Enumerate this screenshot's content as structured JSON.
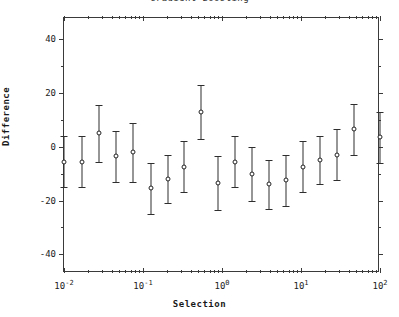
{
  "chart_data": {
    "type": "scatter",
    "title": "Gradient Boosting",
    "xlabel": "Selection",
    "ylabel": "Difference",
    "xscale": "log",
    "yscale": "linear",
    "xlim": [
      0.01,
      100
    ],
    "ylim": [
      -47,
      48
    ],
    "yticks": [
      40,
      20,
      0,
      -20,
      -40
    ],
    "ytick_labels": [
      "40",
      "20",
      "0",
      "-20",
      "-40"
    ],
    "xticks": [
      0.01,
      0.1,
      1,
      10,
      100
    ],
    "xtick_labels": [
      "10-2",
      "10-1",
      "100",
      "101",
      "102"
    ],
    "xtick_mantissa": [
      "10",
      "10",
      "10",
      "10",
      "10"
    ],
    "xtick_exponent": [
      "-2",
      "-1",
      "0",
      "1",
      "2"
    ],
    "grid": false,
    "legend": null,
    "marker": "open-circle",
    "errorbar_style": "capped",
    "series": [
      {
        "name": "Difference vs Selection",
        "x": [
          0.01,
          0.017,
          0.028,
          0.046,
          0.075,
          0.125,
          0.205,
          0.335,
          0.55,
          0.9,
          1.48,
          2.42,
          3.97,
          6.5,
          10.6,
          17.4,
          28.5,
          46.7,
          100.0
        ],
        "y": [
          -5.5,
          -5.5,
          5.0,
          -3.5,
          -2.0,
          -15.5,
          -12.0,
          -7.5,
          13.0,
          -13.5,
          -5.5,
          -10.0,
          -14.0,
          -12.5,
          -7.5,
          -5.0,
          -3.0,
          6.5,
          3.5
        ],
        "yerr": [
          9.5,
          9.5,
          10.5,
          9.5,
          11.0,
          9.5,
          9.0,
          9.5,
          10.0,
          10.0,
          9.5,
          10.0,
          9.0,
          9.5,
          9.5,
          9.0,
          9.5,
          9.5,
          9.5
        ]
      }
    ]
  },
  "axes_geometry": {
    "x_minor_ticks": [
      0.02,
      0.03,
      0.04,
      0.05,
      0.06,
      0.07,
      0.08,
      0.09,
      0.2,
      0.3,
      0.4,
      0.5,
      0.6,
      0.7,
      0.8,
      0.9,
      2,
      3,
      4,
      5,
      6,
      7,
      8,
      9,
      20,
      30,
      40,
      50,
      60,
      70,
      80,
      90
    ],
    "y_minor_ticks": [
      30,
      10,
      -10,
      -30
    ]
  }
}
